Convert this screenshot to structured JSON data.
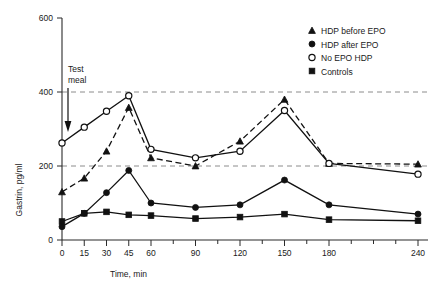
{
  "chart_data": {
    "type": "line",
    "title": "",
    "xlabel": "Time, min",
    "ylabel": "Gastrin, pg/ml",
    "x": [
      0,
      15,
      30,
      45,
      60,
      90,
      120,
      150,
      180,
      240
    ],
    "xlim": [
      0,
      240
    ],
    "ylim": [
      0,
      600
    ],
    "yticks": [
      0,
      200,
      400,
      600
    ],
    "xticks": [
      0,
      15,
      30,
      45,
      60,
      90,
      120,
      150,
      180,
      240
    ],
    "grid": "horizontal dashed gridlines at y=200 and y=400",
    "legend_position": "top-right",
    "series": [
      {
        "name": "HDP before EPO",
        "marker": "filled-triangle",
        "line": "dashed",
        "values": [
          130,
          167,
          240,
          358,
          222,
          200,
          267,
          380,
          207,
          205
        ]
      },
      {
        "name": "HDP after EPO",
        "marker": "filled-circle",
        "line": "solid",
        "values": [
          36,
          72,
          128,
          188,
          100,
          88,
          95,
          162,
          95,
          70
        ]
      },
      {
        "name": "No EPO HDP",
        "marker": "open-circle",
        "line": "solid",
        "values": [
          262,
          305,
          348,
          390,
          245,
          222,
          240,
          350,
          207,
          178
        ]
      },
      {
        "name": "Controls",
        "marker": "filled-square",
        "line": "solid",
        "values": [
          50,
          72,
          76,
          68,
          66,
          58,
          62,
          70,
          55,
          52
        ]
      }
    ]
  },
  "annotations": {
    "test_meal": {
      "line1": "Test",
      "line2": "meal",
      "arrow_x_value": 0
    }
  },
  "legend": {
    "items": [
      {
        "label": "HDP before EPO",
        "marker": "filled-triangle"
      },
      {
        "label": "HDP after EPO",
        "marker": "filled-circle"
      },
      {
        "label": "No EPO HDP",
        "marker": "open-circle"
      },
      {
        "label": "Controls",
        "marker": "filled-square"
      }
    ]
  },
  "axes": {
    "y_tick_labels": [
      "600",
      "400",
      "200",
      "0"
    ],
    "x_tick_labels": [
      "0",
      "15",
      "30",
      "45",
      "60",
      "90",
      "120",
      "150",
      "180",
      "240"
    ],
    "x_title": "Time, min",
    "y_title": "Gastrin, pg/ml"
  },
  "colors": {
    "ink": "#111111",
    "grid": "#8c8c8c",
    "background": "#ffffff"
  }
}
